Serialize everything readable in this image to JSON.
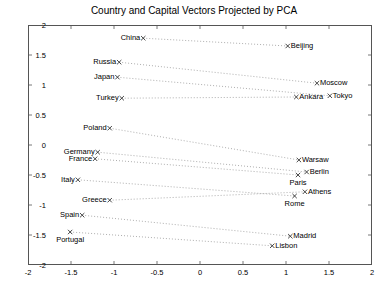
{
  "chart_data": {
    "type": "scatter",
    "title": "Country and Capital Vectors Projected by PCA",
    "xlabel": "",
    "ylabel": "",
    "xlim": [
      -2,
      2
    ],
    "ylim": [
      -2,
      2
    ],
    "grid": false,
    "legend": "none",
    "xticks": [
      "-2",
      "-1.5",
      "-1",
      "-0.5",
      "0",
      "0.5",
      "1",
      "1.5",
      "2"
    ],
    "xtick_values": [
      -2,
      -1.5,
      -1,
      -0.5,
      0,
      0.5,
      1,
      1.5,
      2
    ],
    "yticks": [
      "-2",
      "-1.5",
      "-1",
      "-0.5",
      "0",
      "0.5",
      "1",
      "1.5",
      "2"
    ],
    "ytick_values": [
      -2,
      -1.5,
      -1,
      -0.5,
      0,
      0.5,
      1,
      1.5,
      2
    ],
    "marker": "x",
    "marker_color": "#333333",
    "line_style": "dotted",
    "line_color": "#999999",
    "pairs": [
      {
        "country": "China",
        "country_xy": [
          -0.66,
          1.78
        ],
        "country_label_pos": "left",
        "capital": "Beijing",
        "capital_xy": [
          1.02,
          1.65
        ],
        "capital_label_pos": "right"
      },
      {
        "country": "Russia",
        "country_xy": [
          -0.94,
          1.38
        ],
        "country_label_pos": "left",
        "capital": "Moscow",
        "capital_xy": [
          1.36,
          1.03
        ],
        "capital_label_pos": "right"
      },
      {
        "country": "Japan",
        "country_xy": [
          -0.96,
          1.13
        ],
        "country_label_pos": "left",
        "capital": "Tokyo",
        "capital_xy": [
          1.51,
          0.82
        ],
        "capital_label_pos": "right"
      },
      {
        "country": "Turkey",
        "country_xy": [
          -0.91,
          0.78
        ],
        "country_label_pos": "left",
        "capital": "Ankara",
        "capital_xy": [
          1.12,
          0.8
        ],
        "capital_label_pos": "right"
      },
      {
        "country": "Poland",
        "country_xy": [
          -1.05,
          0.28
        ],
        "country_label_pos": "left",
        "capital": "Warsaw",
        "capital_xy": [
          1.15,
          -0.25
        ],
        "capital_label_pos": "right"
      },
      {
        "country": "Germany",
        "country_xy": [
          -1.19,
          -0.12
        ],
        "country_label_pos": "left",
        "capital": "Berlin",
        "capital_xy": [
          1.24,
          -0.45
        ],
        "capital_label_pos": "right"
      },
      {
        "country": "France",
        "country_xy": [
          -1.22,
          -0.23
        ],
        "country_label_pos": "left",
        "capital": "Paris",
        "capital_xy": [
          1.14,
          -0.5
        ],
        "capital_label_pos": "below"
      },
      {
        "country": "Italy",
        "country_xy": [
          -1.42,
          -0.58
        ],
        "country_label_pos": "left",
        "capital": "Rome",
        "capital_xy": [
          1.1,
          -0.85
        ],
        "capital_label_pos": "below"
      },
      {
        "country": "Greece",
        "country_xy": [
          -1.05,
          -0.92
        ],
        "country_label_pos": "left",
        "capital": "Athens",
        "capital_xy": [
          1.22,
          -0.78
        ],
        "capital_label_pos": "right"
      },
      {
        "country": "Spain",
        "country_xy": [
          -1.37,
          -1.17
        ],
        "country_label_pos": "left",
        "capital": "Madrid",
        "capital_xy": [
          1.05,
          -1.52
        ],
        "capital_label_pos": "right"
      },
      {
        "country": "Portugal",
        "country_xy": [
          -1.51,
          -1.45
        ],
        "country_label_pos": "below",
        "capital": "Lisbon",
        "capital_xy": [
          0.84,
          -1.68
        ],
        "capital_label_pos": "right"
      }
    ]
  }
}
